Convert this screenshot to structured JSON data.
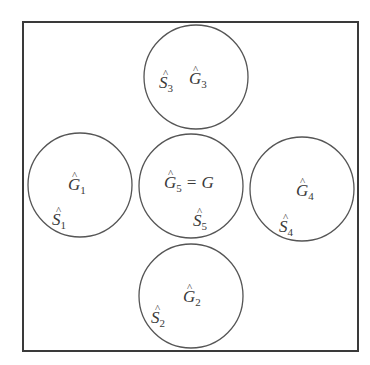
{
  "diagram": {
    "type": "set-cover-diagram",
    "frame": {
      "x": 23,
      "y": 22,
      "width": 335,
      "height": 329
    },
    "stroke_color": "#555555",
    "text_color": "#3a3a3a",
    "circles": [
      {
        "id": "1",
        "cx": 80,
        "cy": 185,
        "r": 52,
        "g_label": {
          "base": "G",
          "hat": "^",
          "sub": "1",
          "suffix": "",
          "x": 68,
          "y": 190
        },
        "s_label": {
          "base": "S",
          "hat": "^",
          "sub": "1",
          "x": 52,
          "y": 225
        }
      },
      {
        "id": "2",
        "cx": 191,
        "cy": 296,
        "r": 52,
        "g_label": {
          "base": "G",
          "hat": "^",
          "sub": "2",
          "suffix": "",
          "x": 183,
          "y": 302
        },
        "s_label": {
          "base": "S",
          "hat": "^",
          "sub": "2",
          "x": 151,
          "y": 323
        }
      },
      {
        "id": "3",
        "cx": 196,
        "cy": 77,
        "r": 52,
        "g_label": {
          "base": "G",
          "hat": "^",
          "sub": "3",
          "suffix": "",
          "x": 189,
          "y": 84
        },
        "s_label": {
          "base": "S",
          "hat": "^",
          "sub": "3",
          "x": 159,
          "y": 88
        }
      },
      {
        "id": "4",
        "cx": 302,
        "cy": 189,
        "r": 52,
        "g_label": {
          "base": "G",
          "hat": "^",
          "sub": "4",
          "suffix": "",
          "x": 296,
          "y": 196
        },
        "s_label": {
          "base": "S",
          "hat": "^",
          "sub": "4",
          "x": 279,
          "y": 232
        }
      },
      {
        "id": "5",
        "cx": 191,
        "cy": 186,
        "r": 52,
        "g_label": {
          "base": "G",
          "hat": "^",
          "sub": "5",
          "suffix": "= G",
          "x": 164,
          "y": 188
        },
        "s_label": {
          "base": "S",
          "hat": "^",
          "sub": "5",
          "x": 193,
          "y": 226
        }
      }
    ],
    "labels_text": {
      "g1": "Ĝ₁",
      "g2": "Ĝ₂",
      "g3": "Ĝ₃",
      "g4": "Ĝ₄",
      "g5": "Ĝ₅ = G",
      "s1": "Ŝ₁",
      "s2": "Ŝ₂",
      "s3": "Ŝ₃",
      "s4": "Ŝ₄",
      "s5": "Ŝ₅"
    }
  }
}
